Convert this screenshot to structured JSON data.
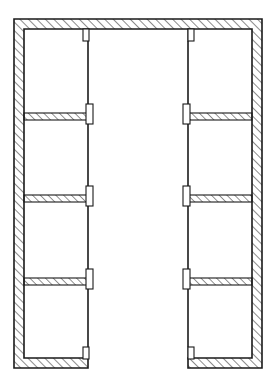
{
  "drawing": {
    "title": "Floor Plan",
    "type": "architectural-floor-plan",
    "plan_shape": "U-shaped",
    "canvas": {
      "width": 277,
      "height": 385
    },
    "background_color": "#ffffff",
    "line_color": "#1a1a1a",
    "hatch_color": "#1a1a1a",
    "fill_color": "#ffffff",
    "outline_stroke_width": 1.6,
    "partition_stroke_width": 1.1,
    "thin_line_stroke_width": 1.1
  },
  "geometry": {
    "outer": {
      "left": 14,
      "top": 19,
      "right": 262,
      "bottom": 368
    },
    "outer_wall_thickness": 10,
    "left_wing": {
      "outer_x": 14,
      "inner_x": 88
    },
    "right_wing": {
      "outer_x": 262,
      "inner_x": 188
    },
    "courtyard": {
      "left": 88,
      "right": 188,
      "top": 29,
      "bottom": 385
    },
    "partition_rows_y": [
      113,
      195,
      278
    ],
    "partition_thickness": 7,
    "bottom_wall_y": 358,
    "bottom_wall_thickness": 10,
    "stub_width": 6,
    "stub_height": 12
  },
  "rooms": {
    "left_wing_labels": [
      "room-l1",
      "room-l2",
      "room-l3",
      "room-l4"
    ],
    "right_wing_labels": [
      "room-r1",
      "room-r2",
      "room-r3",
      "room-r4"
    ],
    "count": 8
  },
  "hatch": {
    "pattern": "diagonal-45",
    "direction": "lower-left-to-upper-right",
    "spacing": 6,
    "stroke_width": 1.0
  },
  "labels": {
    "plan_label": "",
    "scale_label": "",
    "north_label": ""
  }
}
